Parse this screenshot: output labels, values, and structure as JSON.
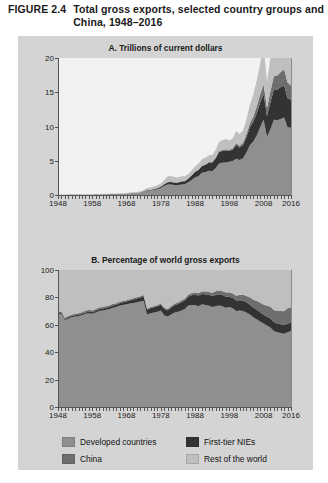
{
  "figure": {
    "label": "FIGURE 2.4",
    "title": "Total gross exports, selected country groups and China, 1948–2016"
  },
  "colors": {
    "developed": "#8f8f8f",
    "first_tier_nies": "#333333",
    "china": "#6e6e6e",
    "rest_of_world": "#bfbfbf",
    "panel_background": "#d4d4d4",
    "plot_a_background": "#f2f2f2",
    "plot_b_background": "#cfcfcf",
    "axis": "#555555"
  },
  "legend": {
    "items": [
      {
        "label": "Developed countries",
        "color": "#8f8f8f",
        "swatch": "swatch-developed"
      },
      {
        "label": "First-tier NIEs",
        "color": "#333333",
        "swatch": "swatch-first-tier-nies"
      },
      {
        "label": "China",
        "color": "#6e6e6e",
        "swatch": "swatch-china"
      },
      {
        "label": "Rest of the world",
        "color": "#bfbfbf",
        "swatch": "swatch-rest-of-world"
      }
    ]
  },
  "chart_data": [
    {
      "id": "panel-a",
      "type": "area",
      "stacked": true,
      "title": "A. Trillions of current dollars",
      "xlabel": "",
      "ylabel": "",
      "ylim": [
        0,
        20
      ],
      "yticks": [
        0,
        5,
        10,
        15,
        20
      ],
      "xlim": [
        1948,
        2016
      ],
      "xticks": [
        1948,
        1958,
        1968,
        1978,
        1988,
        1998,
        2008,
        2016
      ],
      "grid": false,
      "legend_position": "bottom",
      "x": [
        1948,
        1949,
        1950,
        1951,
        1952,
        1953,
        1954,
        1955,
        1956,
        1957,
        1958,
        1959,
        1960,
        1961,
        1962,
        1963,
        1964,
        1965,
        1966,
        1967,
        1968,
        1969,
        1970,
        1971,
        1972,
        1973,
        1974,
        1975,
        1976,
        1977,
        1978,
        1979,
        1980,
        1981,
        1982,
        1983,
        1984,
        1985,
        1986,
        1987,
        1988,
        1989,
        1990,
        1991,
        1992,
        1993,
        1994,
        1995,
        1996,
        1997,
        1998,
        1999,
        2000,
        2001,
        2002,
        2003,
        2004,
        2005,
        2006,
        2007,
        2008,
        2009,
        2010,
        2011,
        2012,
        2013,
        2014,
        2015,
        2016
      ],
      "series": [
        {
          "name": "Developed countries",
          "color": "#8f8f8f",
          "values": [
            0.04,
            0.04,
            0.04,
            0.06,
            0.06,
            0.06,
            0.06,
            0.07,
            0.08,
            0.08,
            0.08,
            0.09,
            0.1,
            0.11,
            0.11,
            0.12,
            0.14,
            0.15,
            0.17,
            0.18,
            0.2,
            0.23,
            0.26,
            0.29,
            0.35,
            0.47,
            0.61,
            0.65,
            0.72,
            0.84,
            1.02,
            1.3,
            1.55,
            1.53,
            1.45,
            1.44,
            1.52,
            1.56,
            1.85,
            2.2,
            2.55,
            2.75,
            3.25,
            3.32,
            3.55,
            3.48,
            3.9,
            4.6,
            4.7,
            4.75,
            4.85,
            4.95,
            5.3,
            5.1,
            5.35,
            6.2,
            7.25,
            7.8,
            8.7,
            9.9,
            11.0,
            8.5,
            9.6,
            11.0,
            10.9,
            11.1,
            11.3,
            9.9,
            9.8
          ]
        },
        {
          "name": "First-tier NIEs",
          "color": "#333333",
          "values": [
            0.0,
            0.0,
            0.0,
            0.01,
            0.01,
            0.01,
            0.01,
            0.01,
            0.01,
            0.01,
            0.01,
            0.01,
            0.01,
            0.01,
            0.01,
            0.01,
            0.01,
            0.01,
            0.02,
            0.02,
            0.02,
            0.03,
            0.03,
            0.04,
            0.05,
            0.07,
            0.1,
            0.1,
            0.13,
            0.16,
            0.2,
            0.26,
            0.32,
            0.36,
            0.36,
            0.38,
            0.44,
            0.44,
            0.52,
            0.66,
            0.82,
            0.9,
            0.97,
            1.08,
            1.17,
            1.26,
            1.42,
            1.68,
            1.72,
            1.76,
            1.58,
            1.7,
            2.0,
            1.82,
            1.95,
            2.25,
            2.65,
            2.9,
            3.25,
            3.55,
            3.75,
            3.05,
            3.95,
            4.45,
            4.5,
            4.65,
            4.7,
            4.25,
            4.1
          ]
        },
        {
          "name": "China",
          "color": "#6e6e6e",
          "values": [
            0.0,
            0.0,
            0.0,
            0.0,
            0.0,
            0.0,
            0.0,
            0.0,
            0.0,
            0.0,
            0.0,
            0.0,
            0.0,
            0.0,
            0.0,
            0.0,
            0.0,
            0.0,
            0.0,
            0.0,
            0.0,
            0.0,
            0.01,
            0.01,
            0.01,
            0.01,
            0.01,
            0.01,
            0.01,
            0.01,
            0.01,
            0.02,
            0.02,
            0.02,
            0.02,
            0.02,
            0.03,
            0.03,
            0.03,
            0.04,
            0.05,
            0.05,
            0.06,
            0.07,
            0.08,
            0.09,
            0.12,
            0.15,
            0.15,
            0.18,
            0.18,
            0.19,
            0.25,
            0.27,
            0.33,
            0.44,
            0.59,
            0.76,
            0.97,
            1.22,
            1.43,
            1.2,
            1.58,
            1.9,
            2.05,
            2.21,
            2.34,
            2.27,
            2.1
          ]
        },
        {
          "name": "Rest of the world",
          "color": "#bfbfbf",
          "values": [
            0.02,
            0.02,
            0.02,
            0.03,
            0.03,
            0.03,
            0.03,
            0.03,
            0.04,
            0.04,
            0.04,
            0.04,
            0.04,
            0.05,
            0.05,
            0.05,
            0.06,
            0.06,
            0.07,
            0.07,
            0.08,
            0.09,
            0.1,
            0.11,
            0.13,
            0.17,
            0.3,
            0.32,
            0.37,
            0.42,
            0.45,
            0.62,
            0.85,
            0.87,
            0.8,
            0.72,
            0.73,
            0.7,
            0.62,
            0.68,
            0.75,
            0.85,
            0.95,
            0.95,
            1.0,
            1.0,
            1.12,
            1.32,
            1.45,
            1.5,
            1.35,
            1.45,
            1.8,
            1.7,
            1.8,
            2.15,
            2.7,
            3.2,
            3.8,
            4.5,
            5.4,
            3.9,
            4.8,
            6.0,
            6.05,
            5.9,
            5.7,
            4.4,
            4.2
          ]
        }
      ]
    },
    {
      "id": "panel-b",
      "type": "area",
      "stacked": true,
      "title": "B. Percentage of world gross exports",
      "xlabel": "",
      "ylabel": "",
      "ylim": [
        0,
        100
      ],
      "yticks": [
        0,
        20,
        40,
        60,
        80,
        100
      ],
      "xlim": [
        1948,
        2016
      ],
      "xticks": [
        1948,
        1958,
        1968,
        1978,
        1988,
        1998,
        2008,
        2016
      ],
      "grid": false,
      "legend_position": "bottom",
      "x": [
        1948,
        1949,
        1950,
        1951,
        1952,
        1953,
        1954,
        1955,
        1956,
        1957,
        1958,
        1959,
        1960,
        1961,
        1962,
        1963,
        1964,
        1965,
        1966,
        1967,
        1968,
        1969,
        1970,
        1971,
        1972,
        1973,
        1974,
        1975,
        1976,
        1977,
        1978,
        1979,
        1980,
        1981,
        1982,
        1983,
        1984,
        1985,
        1986,
        1987,
        1988,
        1989,
        1990,
        1991,
        1992,
        1993,
        1994,
        1995,
        1996,
        1997,
        1998,
        1999,
        2000,
        2001,
        2002,
        2003,
        2004,
        2005,
        2006,
        2007,
        2008,
        2009,
        2010,
        2011,
        2012,
        2013,
        2014,
        2015,
        2016
      ],
      "series": [
        {
          "name": "Developed countries",
          "color": "#8f8f8f",
          "values": [
            67.5,
            68.0,
            63.5,
            64.5,
            65.5,
            66.0,
            66.5,
            67.0,
            68.0,
            68.5,
            68.0,
            69.0,
            70.0,
            70.5,
            71.0,
            71.5,
            72.5,
            73.0,
            74.0,
            74.5,
            75.0,
            75.5,
            76.0,
            76.5,
            77.0,
            77.5,
            67.5,
            68.5,
            69.0,
            69.5,
            70.5,
            67.0,
            66.0,
            67.5,
            69.0,
            69.5,
            70.5,
            71.5,
            74.0,
            74.5,
            74.5,
            73.5,
            75.0,
            74.5,
            74.0,
            73.0,
            73.5,
            74.0,
            73.5,
            72.5,
            73.0,
            72.0,
            70.0,
            70.5,
            70.0,
            69.0,
            67.5,
            65.5,
            64.0,
            62.5,
            61.0,
            59.5,
            58.0,
            55.5,
            54.5,
            54.0,
            53.5,
            54.5,
            55.5
          ]
        },
        {
          "name": "First-tier NIEs",
          "color": "#333333",
          "values": [
            0.8,
            0.8,
            0.8,
            0.9,
            0.9,
            0.9,
            0.9,
            1.0,
            1.0,
            1.1,
            1.1,
            1.2,
            1.3,
            1.3,
            1.4,
            1.5,
            1.6,
            1.7,
            1.8,
            1.9,
            2.0,
            2.2,
            2.4,
            2.6,
            2.9,
            3.2,
            3.4,
            3.5,
            3.8,
            4.0,
            4.2,
            4.5,
            4.6,
            5.0,
            5.3,
            5.6,
            6.0,
            6.2,
            6.5,
            7.0,
            7.5,
            7.8,
            7.5,
            7.8,
            7.9,
            8.0,
            8.2,
            8.3,
            8.2,
            8.0,
            7.5,
            7.6,
            7.7,
            7.5,
            7.6,
            7.4,
            7.2,
            7.0,
            6.9,
            6.6,
            6.4,
            6.4,
            6.6,
            6.5,
            6.4,
            6.4,
            6.3,
            6.3,
            6.2
          ]
        },
        {
          "name": "China",
          "color": "#6e6e6e",
          "values": [
            0.9,
            0.9,
            0.9,
            1.0,
            1.0,
            1.1,
            1.1,
            1.2,
            1.2,
            1.3,
            1.3,
            1.4,
            1.4,
            1.2,
            1.1,
            1.1,
            1.1,
            1.1,
            1.1,
            1.0,
            1.0,
            1.0,
            1.0,
            1.0,
            1.0,
            1.0,
            0.9,
            0.9,
            0.8,
            0.8,
            0.8,
            0.9,
            0.9,
            1.0,
            1.1,
            1.1,
            1.2,
            1.3,
            1.4,
            1.5,
            1.6,
            1.7,
            1.8,
            2.0,
            2.2,
            2.3,
            2.7,
            2.8,
            2.8,
            3.0,
            3.1,
            3.2,
            3.5,
            3.8,
            4.3,
            4.7,
            5.2,
            5.8,
            6.4,
            7.0,
            7.2,
            8.0,
            8.5,
            8.7,
            9.4,
            9.7,
            10.0,
            11.2,
            11.0
          ]
        },
        {
          "name": "Rest of the world",
          "color": "#bfbfbf",
          "values": [
            30.8,
            30.3,
            34.8,
            33.6,
            32.6,
            32.0,
            31.5,
            30.8,
            29.8,
            29.1,
            29.6,
            28.4,
            27.3,
            27.0,
            26.5,
            25.9,
            24.8,
            24.2,
            23.1,
            22.6,
            22.0,
            21.3,
            20.6,
            19.9,
            19.1,
            18.3,
            28.2,
            27.1,
            26.4,
            25.7,
            24.5,
            27.6,
            28.5,
            26.5,
            24.6,
            23.8,
            22.3,
            21.0,
            18.1,
            17.0,
            16.4,
            17.0,
            15.7,
            15.7,
            15.9,
            16.7,
            15.6,
            14.9,
            15.5,
            16.5,
            16.4,
            17.2,
            18.8,
            18.2,
            18.1,
            18.9,
            20.1,
            21.7,
            22.7,
            23.9,
            25.4,
            26.1,
            26.9,
            29.3,
            29.7,
            29.9,
            30.2,
            28.0,
            27.3
          ]
        }
      ]
    }
  ]
}
